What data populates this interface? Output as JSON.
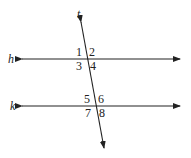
{
  "diagram": {
    "lines": [
      {
        "label": "h",
        "x1": 22,
        "y1": 59,
        "x2": 180,
        "y2": 59
      },
      {
        "label": "k",
        "x1": 22,
        "y1": 106,
        "x2": 180,
        "y2": 106
      },
      {
        "label": "t",
        "x1": 81,
        "y1": 22,
        "x2": 104,
        "y2": 148
      }
    ],
    "labels": {
      "h": "h",
      "k": "k",
      "t": "t"
    },
    "angles": [
      "1",
      "2",
      "3",
      "4",
      "5",
      "6",
      "7",
      "8"
    ],
    "color": "#222222"
  }
}
